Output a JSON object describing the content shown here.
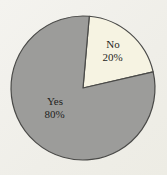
{
  "chart_data": {
    "type": "pie",
    "title": "",
    "legend": "none",
    "direction": "clockwise",
    "start_angle_deg": 5,
    "background_color": "#f1f0eb",
    "outline_color": "#4a4a48",
    "text_color": "#1f1f1d",
    "slices": [
      {
        "label": "No",
        "value": 20,
        "value_label": "20%",
        "color": "#f6f3e2"
      },
      {
        "label": "Yes",
        "value": 80,
        "value_label": "80%",
        "color": "#9c9c9a"
      }
    ]
  }
}
